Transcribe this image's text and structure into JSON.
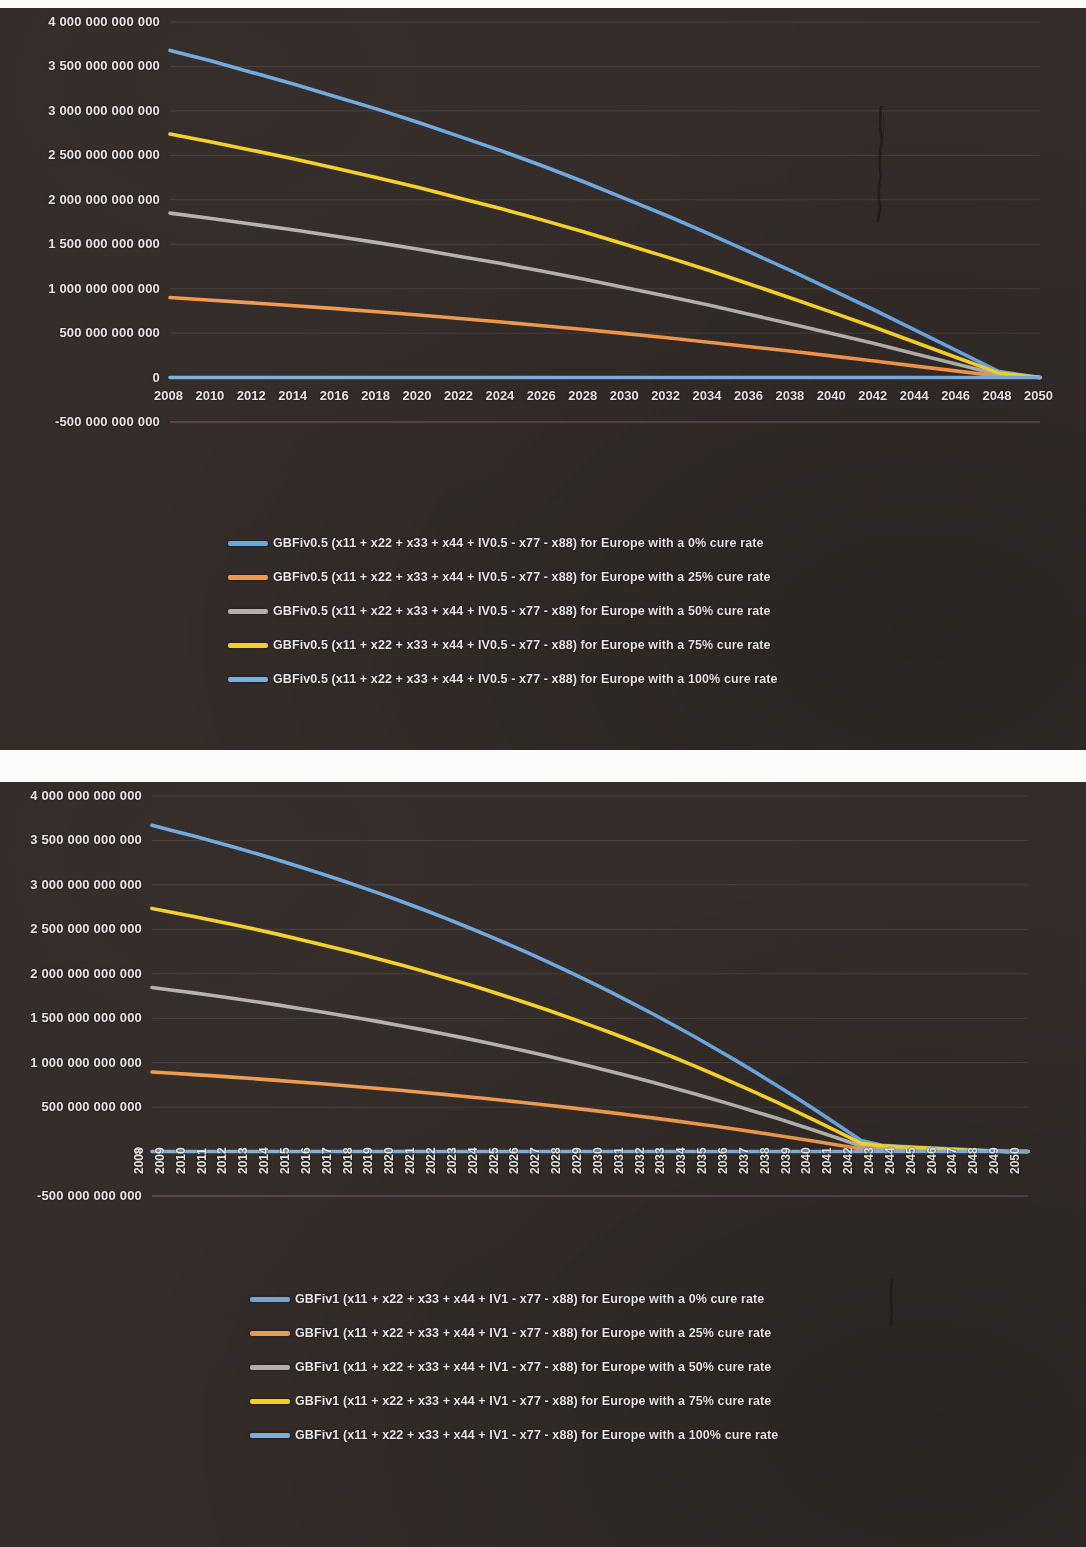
{
  "document": {
    "kind": "photographed-printout",
    "background_color": "#332c29",
    "text_color": "#e9e6e2"
  },
  "palette": {
    "blue": "#6fa8dc",
    "orange": "#ed9b4f",
    "gray": "#b4b2ad",
    "yellow": "#f3d12a",
    "light_blue": "#7fb0de"
  },
  "charts": [
    {
      "id": "chart-top",
      "chart_data": {
        "type": "line",
        "title": "",
        "xlabel": "",
        "ylabel": "",
        "grid": true,
        "legend_position": "bottom",
        "xlim": [
          2008,
          2050
        ],
        "ylim": [
          -500000000000,
          4000000000000
        ],
        "ytick_labels": [
          "4 000 000 000 000",
          "3 500 000 000 000",
          "3 000 000 000 000",
          "2 500 000 000 000",
          "2 000 000 000 000",
          "1 500 000 000 000",
          "1 000 000 000 000",
          "500 000 000 000",
          "0",
          "-500 000 000 000"
        ],
        "ytick_values": [
          4000000000000,
          3500000000000,
          3000000000000,
          2500000000000,
          2000000000000,
          1500000000000,
          1000000000000,
          500000000000,
          0,
          -500000000000
        ],
        "x": [
          2008,
          2010,
          2012,
          2014,
          2016,
          2018,
          2020,
          2022,
          2024,
          2026,
          2028,
          2030,
          2032,
          2034,
          2036,
          2038,
          2040,
          2042,
          2044,
          2046,
          2048,
          2050
        ],
        "xtick_labels": [
          "2008",
          "2010",
          "2012",
          "2014",
          "2016",
          "2018",
          "2020",
          "2022",
          "2024",
          "2026",
          "2028",
          "2030",
          "2032",
          "2034",
          "2036",
          "2038",
          "2040",
          "2042",
          "2044",
          "2046",
          "2048",
          "2050"
        ],
        "series": [
          {
            "name": "GBFiv0.5 (x11 + x22 + x33 + x44 + IV0.5 - x77 - x88) for Europe with a 0% cure rate",
            "color": "#6fa8dc",
            "start_value": 3680000000000,
            "end_value": 0,
            "end_year": 2049,
            "values": [
              3680000000000,
              3560000000000,
              3430000000000,
              3300000000000,
              3160000000000,
              3020000000000,
              2870000000000,
              2710000000000,
              2550000000000,
              2380000000000,
              2200000000000,
              2010000000000,
              1820000000000,
              1620000000000,
              1410000000000,
              1200000000000,
              980000000000,
              760000000000,
              530000000000,
              300000000000,
              70000000000,
              0
            ]
          },
          {
            "name": "GBFiv0.5 (x11 + x22 + x33 + x44 + IV0.5 - x77 - x88) for Europe with a 25% cure rate",
            "color": "#ed9b4f",
            "start_value": 900000000000,
            "end_value": 0,
            "end_year": 2049,
            "values": [
              900000000000,
              870000000000,
              840000000000,
              808000000000,
              775000000000,
              740000000000,
              703000000000,
              665000000000,
              625000000000,
              583000000000,
              540000000000,
              494000000000,
              447000000000,
              398000000000,
              347000000000,
              295000000000,
              241000000000,
              186000000000,
              129000000000,
              72000000000,
              17000000000,
              0
            ]
          },
          {
            "name": "GBFiv0.5 (x11 + x22 + x33 + x44 + IV0.5 - x77 - x88) for Europe with a 50% cure rate",
            "color": "#b4b2ad",
            "start_value": 1850000000000,
            "end_value": 0,
            "end_year": 2049,
            "values": [
              1850000000000,
              1790000000000,
              1725000000000,
              1660000000000,
              1590000000000,
              1518000000000,
              1443000000000,
              1363000000000,
              1282000000000,
              1196000000000,
              1106000000000,
              1011000000000,
              915000000000,
              815000000000,
              709000000000,
              603000000000,
              493000000000,
              382000000000,
              266000000000,
              151000000000,
              35000000000,
              0
            ]
          },
          {
            "name": "GBFiv0.5 (x11 + x22 + x33 + x44 + IV0.5 - x77 - x88) for Europe with a 75% cure rate",
            "color": "#f3d12a",
            "start_value": 2740000000000,
            "end_value": 0,
            "end_year": 2049,
            "values": [
              2740000000000,
              2650000000000,
              2555000000000,
              2458000000000,
              2354000000000,
              2248000000000,
              2137000000000,
              2018000000000,
              1898000000000,
              1771000000000,
              1638000000000,
              1497000000000,
              1355000000000,
              1207000000000,
              1050000000000,
              893000000000,
              730000000000,
              566000000000,
              394000000000,
              223000000000,
              52000000000,
              0
            ]
          },
          {
            "name": "GBFiv0.5 (x11 + x22 + x33 + x44 + IV0.5 - x77 - x88) for Europe with a 100% cure rate",
            "color": "#7fb0de",
            "start_value": 0,
            "end_value": 0,
            "end_year": 2049,
            "values": [
              0,
              0,
              0,
              0,
              0,
              0,
              0,
              0,
              0,
              0,
              0,
              0,
              0,
              0,
              0,
              0,
              0,
              0,
              0,
              0,
              0,
              0
            ]
          }
        ]
      }
    },
    {
      "id": "chart-bottom",
      "chart_data": {
        "type": "line",
        "title": "",
        "xlabel": "",
        "ylabel": "",
        "grid": true,
        "legend_position": "bottom",
        "xlim": [
          2008,
          2050
        ],
        "ylim": [
          -500000000000,
          4000000000000
        ],
        "ytick_labels": [
          "4 000 000 000 000",
          "3 500 000 000 000",
          "3 000 000 000 000",
          "2 500 000 000 000",
          "2 000 000 000 000",
          "1 500 000 000 000",
          "1 000 000 000 000",
          "500 000 000 000",
          "0",
          "-500 000 000 000"
        ],
        "ytick_values": [
          4000000000000,
          3500000000000,
          3000000000000,
          2500000000000,
          2000000000000,
          1500000000000,
          1000000000000,
          500000000000,
          0,
          -500000000000
        ],
        "x": [
          2008,
          2009,
          2010,
          2011,
          2012,
          2013,
          2014,
          2015,
          2016,
          2017,
          2018,
          2019,
          2020,
          2021,
          2022,
          2023,
          2024,
          2025,
          2026,
          2027,
          2028,
          2029,
          2030,
          2031,
          2032,
          2033,
          2034,
          2035,
          2036,
          2037,
          2038,
          2039,
          2040,
          2041,
          2042,
          2043,
          2044,
          2045,
          2046,
          2047,
          2048,
          2049,
          2050
        ],
        "xtick_labels": [
          "2008",
          "2009",
          "2010",
          "2011",
          "2012",
          "2013",
          "2014",
          "2015",
          "2016",
          "2017",
          "2018",
          "2019",
          "2020",
          "2021",
          "2022",
          "2023",
          "2024",
          "2025",
          "2026",
          "2027",
          "2028",
          "2029",
          "2030",
          "2031",
          "2032",
          "2033",
          "2034",
          "2035",
          "2036",
          "2037",
          "2038",
          "2039",
          "2040",
          "2041",
          "2042",
          "2043",
          "2044",
          "2045",
          "2046",
          "2047",
          "2048",
          "2049",
          "2050"
        ],
        "xtick_rotation": -90,
        "series": [
          {
            "name": "GBFiv1 (x11 + x22 + x33 + x44 + IV1 - x77 - x88) for Europe with a 0% cure rate",
            "color": "#6fa8dc",
            "start_value": 3670000000000,
            "end_value": 0,
            "end_year": 2049,
            "values": [
              3670000000000,
              3610000000000,
              3550000000000,
              3485000000000,
              3420000000000,
              3352000000000,
              3282000000000,
              3210000000000,
              3135000000000,
              3058000000000,
              2978000000000,
              2896000000000,
              2811000000000,
              2723000000000,
              2632000000000,
              2538000000000,
              2441000000000,
              2341000000000,
              2238000000000,
              2132000000000,
              2022000000000,
              1909000000000,
              1793000000000,
              1673000000000,
              1550000000000,
              1424000000000,
              1294000000000,
              1160000000000,
              1023000000000,
              882000000000,
              738000000000,
              590000000000,
              438000000000,
              283000000000,
              124000000000,
              70000000000,
              55000000000,
              44000000000,
              33000000000,
              22000000000,
              11000000000,
              0,
              0
            ]
          },
          {
            "name": "GBFiv1 (x11 + x22 + x33 + x44 + IV1 - x77 - x88) for Europe with a 25% cure rate",
            "color": "#ed9b4f",
            "start_value": 895000000000,
            "end_value": 0,
            "end_year": 2049,
            "values": [
              895000000000,
              881000000000,
              866000000000,
              851000000000,
              835000000000,
              818000000000,
              801000000000,
              783000000000,
              765000000000,
              746000000000,
              727000000000,
              707000000000,
              686000000000,
              665000000000,
              643000000000,
              620000000000,
              596000000000,
              572000000000,
              547000000000,
              521000000000,
              494000000000,
              466000000000,
              438000000000,
              409000000000,
              379000000000,
              348000000000,
              316000000000,
              284000000000,
              250000000000,
              216000000000,
              180000000000,
              144000000000,
              107000000000,
              69000000000,
              30000000000,
              22000000000,
              17000000000,
              13000000000,
              9000000000,
              6000000000,
              3000000000,
              0,
              0
            ]
          },
          {
            "name": "GBFiv1 (x11 + x22 + x33 + x44 + IV1 - x77 - x88) for Europe with a 50% cure rate",
            "color": "#b4b2ad",
            "start_value": 1845000000000,
            "end_value": 0,
            "end_year": 2049,
            "values": [
              1845000000000,
              1815000000000,
              1785000000000,
              1752000000000,
              1719000000000,
              1685000000000,
              1650000000000,
              1613000000000,
              1576000000000,
              1537000000000,
              1497000000000,
              1456000000000,
              1413000000000,
              1369000000000,
              1323000000000,
              1276000000000,
              1227000000000,
              1177000000000,
              1125000000000,
              1072000000000,
              1016000000000,
              959000000000,
              901000000000,
              841000000000,
              779000000000,
              716000000000,
              650000000000,
              583000000000,
              514000000000,
              443000000000,
              371000000000,
              296000000000,
              220000000000,
              142000000000,
              62000000000,
              45000000000,
              35000000000,
              27000000000,
              19000000000,
              12000000000,
              6000000000,
              0,
              0
            ]
          },
          {
            "name": "GBFiv1 (x11 + x22 + x33 + x44 + IV1 - x77 - x88) for Europe with a 75% cure rate",
            "color": "#f3d12a",
            "start_value": 2735000000000,
            "end_value": 0,
            "end_year": 2049,
            "values": [
              2735000000000,
              2690000000000,
              2645000000000,
              2597000000000,
              2548000000000,
              2498000000000,
              2446000000000,
              2392000000000,
              2336000000000,
              2279000000000,
              2219000000000,
              2158000000000,
              2095000000000,
              2030000000000,
              1962000000000,
              1892000000000,
              1820000000000,
              1745000000000,
              1668000000000,
              1589000000000,
              1507000000000,
              1423000000000,
              1336000000000,
              1247000000000,
              1155000000000,
              1061000000000,
              964000000000,
              864000000000,
              762000000000,
              657000000000,
              550000000000,
              439000000000,
              326000000000,
              211000000000,
              92000000000,
              66000000000,
              51000000000,
              40000000000,
              28000000000,
              18000000000,
              9000000000,
              0,
              0
            ]
          },
          {
            "name": "GBFiv1 (x11 + x22 + x33 + x44 + IV1 - x77 - x88) for Europe with a 100% cure rate",
            "color": "#7fb0de",
            "start_value": 0,
            "end_value": 0,
            "end_year": 2049,
            "values": [
              0,
              0,
              0,
              0,
              0,
              0,
              0,
              0,
              0,
              0,
              0,
              0,
              0,
              0,
              0,
              0,
              0,
              0,
              0,
              0,
              0,
              0,
              0,
              0,
              0,
              0,
              0,
              0,
              0,
              0,
              0,
              0,
              0,
              0,
              0,
              0,
              0,
              0,
              0,
              0,
              0,
              0,
              0
            ]
          }
        ]
      }
    }
  ]
}
